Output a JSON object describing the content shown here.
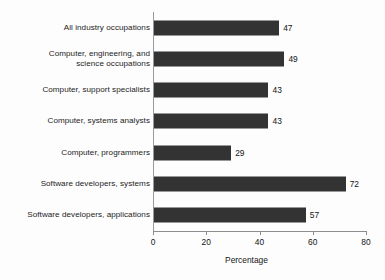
{
  "chart_data": {
    "type": "bar",
    "orientation": "horizontal",
    "title": "",
    "subtitle": "",
    "xlabel": "Percentage",
    "ylabel": "",
    "xlim": [
      0,
      80
    ],
    "xticks": [
      0,
      20,
      40,
      60,
      80
    ],
    "xtick_labels": [
      "0",
      "20",
      "40",
      "60",
      "80"
    ],
    "grid": false,
    "legend": null,
    "bar_color": "#333333",
    "axis_color": "#8d8d8d",
    "background": "#fdfdfd",
    "categories": [
      "All industry occupations",
      "Computer, engineering, and\nscience occupations",
      "Computer, support specialists",
      "Computer, systems analysts",
      "Computer, programmers",
      "Software developers, systems",
      "Software developers, applications"
    ],
    "values": [
      47,
      49,
      43,
      43,
      29,
      72,
      57
    ],
    "value_labels": [
      "47",
      "49",
      "43",
      "43",
      "29",
      "72",
      "57"
    ],
    "bars": [
      {
        "category": "All industry occupations",
        "value": 47,
        "label": "47"
      },
      {
        "category": "Computer, engineering, and\nscience occupations",
        "value": 49,
        "label": "49"
      },
      {
        "category": "Computer, support specialists",
        "value": 43,
        "label": "43"
      },
      {
        "category": "Computer, systems analysts",
        "value": 43,
        "label": "43"
      },
      {
        "category": "Computer, programmers",
        "value": 29,
        "label": "29"
      },
      {
        "category": "Software developers, systems",
        "value": 72,
        "label": "72"
      },
      {
        "category": "Software developers, applications",
        "value": 57,
        "label": "57"
      }
    ]
  }
}
